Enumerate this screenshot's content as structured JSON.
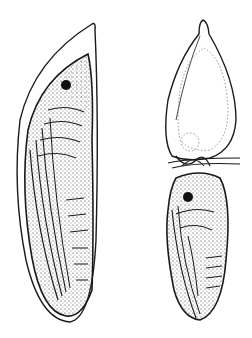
{
  "figure": {
    "type": "scientific-illustration",
    "background": "#ffffff",
    "ink": "#1a1a1a",
    "specimens": [
      {
        "id": "left",
        "description": "elongated pupa inside transparent cocoon, lateral view"
      },
      {
        "id": "right",
        "description": "pupa with empty cocoon/shell above, joined by knotted thread"
      }
    ]
  }
}
